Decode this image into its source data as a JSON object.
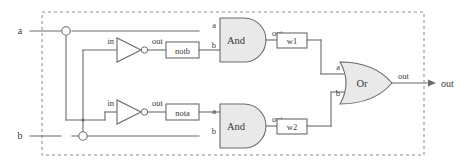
{
  "diagram": {
    "colors": {
      "wire": "#6b6b6b",
      "gate_fill": "#e9e9e9",
      "boundary": "#8a8a8a",
      "background": "#ffffff",
      "text": "#3a3a3a"
    },
    "boundary": {
      "label": "module-boundary",
      "style": "dashed"
    }
  },
  "inputs": [
    {
      "name": "input-a",
      "label": "a"
    },
    {
      "name": "input-b",
      "label": "b"
    }
  ],
  "outputs": [
    {
      "name": "output-out",
      "label": "out"
    }
  ],
  "inverters": [
    {
      "name": "not-gate-notb",
      "in_label": "in",
      "out_label": "out",
      "signal_box": "notb"
    },
    {
      "name": "not-gate-nota",
      "in_label": "in",
      "out_label": "out",
      "signal_box": "nota"
    }
  ],
  "and_gates": [
    {
      "name": "and-gate-top",
      "label": "And",
      "port_a": "a",
      "port_b": "b",
      "port_out": "out",
      "signal_box": "w1"
    },
    {
      "name": "and-gate-bottom",
      "label": "And",
      "port_a": "a",
      "port_b": "b",
      "port_out": "out",
      "signal_box": "w2"
    }
  ],
  "or_gate": {
    "name": "or-gate",
    "label": "Or",
    "port_a": "a",
    "port_b": "b",
    "port_out": "out"
  },
  "wire_labels": {
    "w1": "w1",
    "w2": "w2",
    "nota": "nota",
    "notb": "notb"
  }
}
